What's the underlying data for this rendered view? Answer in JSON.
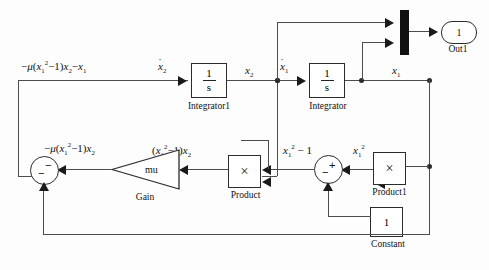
{
  "diagram": {
    "type": "block-diagram"
  },
  "blocks": {
    "integrator1": {
      "label": "Integrator1",
      "numerator": "1",
      "denominator": "s"
    },
    "integrator": {
      "label": "Integrator",
      "numerator": "1",
      "denominator": "s"
    },
    "product": {
      "label": "Product",
      "symbol": "×"
    },
    "product1": {
      "label": "Product1",
      "symbol": "×"
    },
    "constant": {
      "label": "Constant",
      "value": "1"
    },
    "gain": {
      "label": "Gain",
      "value": "mu"
    },
    "mux": {
      "label": "",
      "name": "mux"
    },
    "outport": {
      "label": "Out1",
      "value": "1"
    },
    "sum_left": {
      "label": "",
      "sign_top": "−",
      "sign_bottom": "−"
    },
    "sum_right": {
      "label": "",
      "sign_top": "+",
      "sign_bottom": "−"
    }
  },
  "signals": {
    "sum_out": "−μ(x₁²−1)x₂−x₁",
    "xdot2": "ẋ₂",
    "x2": "x₂",
    "xdot1": "ẋ₁",
    "x1": "x₁",
    "gain_out": "−μ(x₁²−1)x₂",
    "product_out": "(x₁²−1)x₂",
    "sumright_out": "x₁²−1",
    "x1sq": "x₁²"
  },
  "colors": {
    "wire": "#4c4c4c",
    "stroke": "#2b2b2b",
    "fill": "#ffffff",
    "mux": "#111111",
    "text": "#111111",
    "background": "#fdfdfd"
  }
}
